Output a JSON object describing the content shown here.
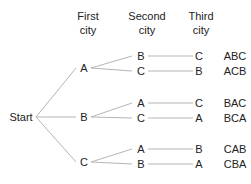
{
  "headers": [
    {
      "line1": "First",
      "line2": "city"
    },
    {
      "line1": "Second",
      "line2": "city"
    },
    {
      "line1": "Third",
      "line2": "city"
    }
  ],
  "root": "Start",
  "first": [
    "A",
    "B",
    "C"
  ],
  "second": [
    "B",
    "C",
    "A",
    "C",
    "A",
    "B"
  ],
  "third": [
    "C",
    "B",
    "C",
    "A",
    "B",
    "A"
  ],
  "routes": [
    "ABC",
    "ACB",
    "BAC",
    "BCA",
    "CAB",
    "CBA"
  ],
  "colors": {
    "line": "#b0b0b0",
    "text": "#222222"
  }
}
